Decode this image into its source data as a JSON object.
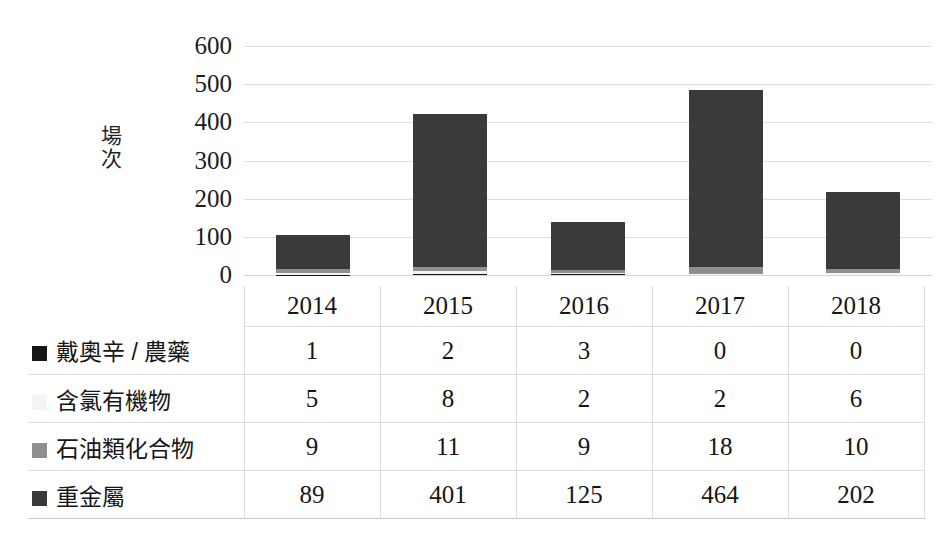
{
  "chart_data": {
    "type": "bar",
    "subtype": "stacked-column",
    "title": "",
    "xlabel": "",
    "ylabel": "場次",
    "ylim": [
      0,
      600
    ],
    "yticks": [
      600,
      500,
      400,
      300,
      200,
      100,
      0
    ],
    "grid": true,
    "legend_position": "table-left",
    "categories": [
      "2014",
      "2015",
      "2016",
      "2017",
      "2018"
    ],
    "series": [
      {
        "name": "戴奧辛 / 農藥",
        "values": [
          1,
          2,
          3,
          0,
          0
        ],
        "color": "#161616"
      },
      {
        "name": "含氯有機物",
        "values": [
          5,
          8,
          2,
          2,
          6
        ],
        "color": "#f4f4f4"
      },
      {
        "name": "石油類化合物",
        "values": [
          9,
          11,
          9,
          18,
          10
        ],
        "color": "#8f8f8f"
      },
      {
        "name": "重金屬",
        "values": [
          89,
          401,
          125,
          464,
          202
        ],
        "color": "#3a3a3a"
      }
    ],
    "totals": [
      104,
      422,
      139,
      484,
      218
    ]
  },
  "axis": {
    "y_label_chars": [
      "場",
      "次"
    ],
    "y_ticks": [
      "600",
      "500",
      "400",
      "300",
      "200",
      "100",
      "0"
    ]
  },
  "table": {
    "corner_label": "",
    "year_headers": [
      "2014",
      "2015",
      "2016",
      "2017",
      "2018"
    ],
    "rows": [
      {
        "label": "戴奧辛 / 農藥",
        "swatch": "swatch-dioxin-pesticide",
        "values": [
          "1",
          "2",
          "3",
          "0",
          "0"
        ]
      },
      {
        "label": "含氯有機物",
        "swatch": "swatch-chlorinated-organics",
        "values": [
          "5",
          "8",
          "2",
          "2",
          "6"
        ]
      },
      {
        "label": "石油類化合物",
        "swatch": "swatch-petroleum-compounds",
        "values": [
          "9",
          "11",
          "9",
          "18",
          "10"
        ]
      },
      {
        "label": "重金屬",
        "swatch": "swatch-heavy-metals",
        "values": [
          "89",
          "401",
          "125",
          "464",
          "202"
        ]
      }
    ]
  },
  "colors": {
    "series_0": "#161616",
    "series_1": "#f4f4f4",
    "series_2": "#8f8f8f",
    "series_3": "#3a3a3a",
    "gridline": "#dedede",
    "background": "#ffffff"
  }
}
